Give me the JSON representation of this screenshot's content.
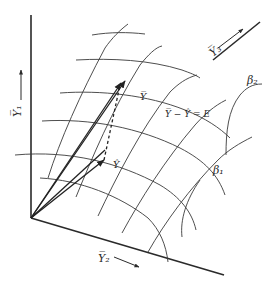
{
  "diagram": {
    "title": "",
    "axes": [
      {
        "id": "y1",
        "label": "Y̅₁",
        "label_text": "Y1",
        "direction": "up"
      },
      {
        "id": "y2",
        "label": "Y̅₂",
        "label_text": "Y2",
        "direction": "right-down"
      },
      {
        "id": "y3",
        "label": "Y̅₃",
        "label_text": "Y3",
        "direction": "right-up"
      }
    ],
    "surface_parameters": [
      {
        "id": "beta1",
        "label": "β₁"
      },
      {
        "id": "beta2",
        "label": "β₂"
      }
    ],
    "vectors": [
      {
        "id": "Y",
        "label": "Y̅",
        "style": "solid"
      },
      {
        "id": "Y_hat",
        "label": "Ŷ",
        "style": "solid"
      },
      {
        "id": "error",
        "label": "Y̅ − Ŷ = E",
        "style": "dashed"
      }
    ],
    "colors": {
      "ink": "#2a2a2a",
      "background": "#ffffff"
    }
  }
}
